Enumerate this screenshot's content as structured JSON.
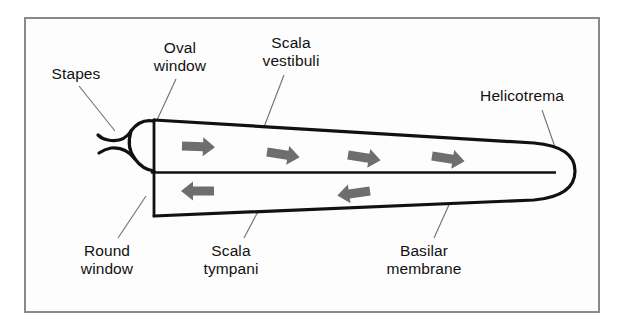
{
  "figure": {
    "background_color": "#fdfdfd",
    "frame_color": "#8a8a8a",
    "outline_color": "#111111",
    "arrow_color": "#6e6e6e",
    "leader_color": "#6f6f6f",
    "text_color": "#111111"
  },
  "labels": [
    {
      "key": "stapes",
      "name": "label-stapes",
      "lines": [
        "Stapes"
      ],
      "x": 36,
      "y": 65,
      "width": 80,
      "align": "center"
    },
    {
      "key": "oval_window",
      "name": "label-oval-window",
      "lines": [
        "Oval",
        "window"
      ],
      "x": 134,
      "y": 39,
      "width": 92,
      "align": "center"
    },
    {
      "key": "scala_vestibuli",
      "name": "label-scala-vestibuli",
      "lines": [
        "Scala",
        "vestibuli"
      ],
      "x": 243,
      "y": 34,
      "width": 96,
      "align": "center"
    },
    {
      "key": "helicotrema",
      "name": "label-helicotrema",
      "lines": [
        "Helicotrema"
      ],
      "x": 460,
      "y": 87,
      "width": 124,
      "align": "center"
    },
    {
      "key": "round_window",
      "name": "label-round-window",
      "lines": [
        "Round",
        "window"
      ],
      "x": 60,
      "y": 242,
      "width": 94,
      "align": "center"
    },
    {
      "key": "scala_tympani",
      "name": "label-scala-tympani",
      "lines": [
        "Scala",
        "tympani"
      ],
      "x": 183,
      "y": 242,
      "width": 96,
      "align": "center"
    },
    {
      "key": "basilar_membrane",
      "name": "label-basilar-membrane",
      "lines": [
        "Basilar",
        "membrane"
      ],
      "x": 366,
      "y": 242,
      "width": 116,
      "align": "center"
    }
  ],
  "structures": [
    {
      "key": "scala_vestibuli_chamber",
      "name": "scala-vestibuli-chamber"
    },
    {
      "key": "scala_tympani_chamber",
      "name": "scala-tympani-chamber"
    },
    {
      "key": "basilar_membrane_line",
      "name": "basilar-membrane-line"
    },
    {
      "key": "helicotrema_opening",
      "name": "helicotrema-opening"
    },
    {
      "key": "stapes_shape",
      "name": "stapes-shape"
    },
    {
      "key": "oval_window_line",
      "name": "oval-window-line"
    },
    {
      "key": "round_window_line",
      "name": "round-window-line"
    }
  ],
  "arrows": {
    "upper_direction": "right",
    "lower_direction": "left",
    "upper_count": 4,
    "lower_count": 2,
    "meaning_upper": "wave travels apex-ward through scala vestibuli",
    "meaning_lower": "wave returns base-ward through scala tympani"
  }
}
